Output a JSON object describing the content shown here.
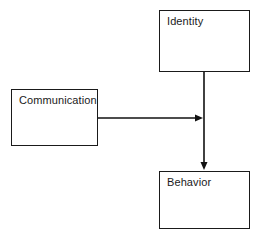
{
  "diagram": {
    "background_color": "#ffffff",
    "line_color": "#111111",
    "border_color": "#1a1a1a",
    "nodes": [
      {
        "id": "identity",
        "label": "Identity",
        "x": 159,
        "y": 10,
        "width": 91,
        "height": 62
      },
      {
        "id": "communication",
        "label": "Communication",
        "x": 11,
        "y": 89,
        "width": 87,
        "height": 57
      },
      {
        "id": "behavior",
        "label": "Behavior",
        "x": 159,
        "y": 171,
        "width": 91,
        "height": 58
      }
    ],
    "edges": [
      {
        "id": "identity-to-behavior",
        "from": "identity",
        "to": "behavior",
        "orientation": "vertical",
        "arrowhead": "end",
        "x1": 204,
        "y1": 72,
        "x2": 204,
        "y2": 170
      },
      {
        "id": "communication-to-behavior",
        "from": "communication",
        "to": "behavior",
        "orientation": "horizontal",
        "arrowhead": "end",
        "x1": 98,
        "y1": 118,
        "x2": 203,
        "y2": 118
      }
    ]
  }
}
